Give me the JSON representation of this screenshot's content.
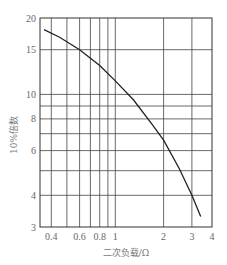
{
  "chart_data": {
    "type": "line",
    "title": "",
    "xlabel": "二次负载/Ω",
    "ylabel": "10%倍数",
    "x_scale": "log",
    "y_scale": "log",
    "xlim": [
      0.34,
      4
    ],
    "ylim": [
      3,
      20
    ],
    "grid": true,
    "legend": null,
    "x_ticks": [
      0.4,
      0.6,
      0.8,
      1,
      2,
      3,
      4
    ],
    "x_tick_labels": [
      "0.4",
      "0.6",
      "0.8",
      "1",
      "2",
      "3",
      "4"
    ],
    "x_gridlines": [
      0.4,
      0.5,
      0.6,
      0.7,
      0.8,
      0.9,
      1,
      2,
      3
    ],
    "y_ticks": [
      3,
      4,
      6,
      8,
      10,
      15,
      20
    ],
    "y_tick_labels": [
      "3",
      "4",
      "6",
      "8",
      "10",
      "15",
      "20"
    ],
    "y_gridlines": [
      4,
      5,
      6,
      7,
      8,
      9,
      10,
      15
    ],
    "series": [
      {
        "name": "10%倍数曲线",
        "x": [
          0.36,
          0.45,
          0.6,
          0.8,
          1.0,
          1.3,
          1.7,
          2.0,
          2.5,
          3.0,
          3.4
        ],
        "values": [
          18,
          16.8,
          15,
          13,
          11.3,
          9.5,
          7.6,
          6.6,
          5.1,
          4.0,
          3.3
        ]
      }
    ]
  },
  "top_strip_text": "————  ——————————————  — — —"
}
